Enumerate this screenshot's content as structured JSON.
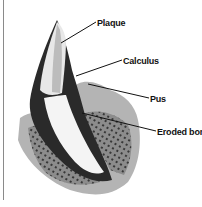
{
  "diagram": {
    "labels": [
      {
        "id": "plaque",
        "text": "Plaque"
      },
      {
        "id": "calculus",
        "text": "Calculus"
      },
      {
        "id": "pus",
        "text": "Pus"
      },
      {
        "id": "eroded-bone",
        "text": "Eroded boni"
      }
    ]
  }
}
